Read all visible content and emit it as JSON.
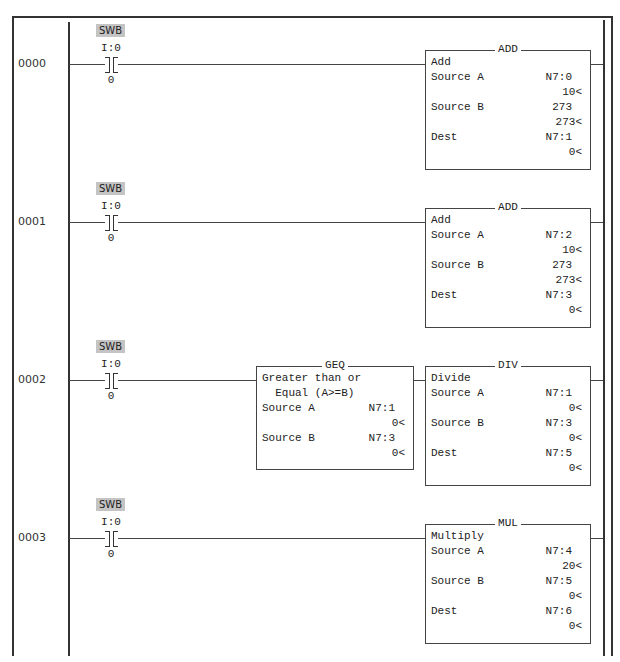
{
  "rungs": [
    {
      "number": "0000",
      "contact": {
        "tag": "SWB",
        "address": "I:0",
        "bit": "0"
      },
      "blocks": [
        {
          "mnemonic": "ADD",
          "description": [
            "Add"
          ],
          "params": [
            {
              "label": "Source A",
              "address": "N7:0",
              "value": "10<"
            },
            {
              "label": "Source B",
              "address": "273",
              "value": "273<"
            },
            {
              "label": "Dest",
              "address": "N7:1",
              "value": "0<"
            }
          ]
        }
      ]
    },
    {
      "number": "0001",
      "contact": {
        "tag": "SWB",
        "address": "I:0",
        "bit": "0"
      },
      "blocks": [
        {
          "mnemonic": "ADD",
          "description": [
            "Add"
          ],
          "params": [
            {
              "label": "Source A",
              "address": "N7:2",
              "value": "10<"
            },
            {
              "label": "Source B",
              "address": "273",
              "value": "273<"
            },
            {
              "label": "Dest",
              "address": "N7:3",
              "value": "0<"
            }
          ]
        }
      ]
    },
    {
      "number": "0002",
      "contact": {
        "tag": "SWB",
        "address": "I:0",
        "bit": "0"
      },
      "blocks": [
        {
          "mnemonic": "GEQ",
          "description": [
            "Greater than or",
            "  Equal (A>=B)"
          ],
          "params": [
            {
              "label": "Source A",
              "address": "N7:1",
              "value": "0<"
            },
            {
              "label": "Source B",
              "address": "N7:3",
              "value": "0<"
            }
          ]
        },
        {
          "mnemonic": "DIV",
          "description": [
            "Divide"
          ],
          "params": [
            {
              "label": "Source A",
              "address": "N7:1",
              "value": "0<"
            },
            {
              "label": "Source B",
              "address": "N7:3",
              "value": "0<"
            },
            {
              "label": "Dest",
              "address": "N7:5",
              "value": "0<"
            }
          ]
        }
      ]
    },
    {
      "number": "0003",
      "contact": {
        "tag": "SWB",
        "address": "I:0",
        "bit": "0"
      },
      "blocks": [
        {
          "mnemonic": "MUL",
          "description": [
            "Multiply"
          ],
          "params": [
            {
              "label": "Source A",
              "address": "N7:4",
              "value": "20<"
            },
            {
              "label": "Source B",
              "address": "N7:5",
              "value": "0<"
            },
            {
              "label": "Dest",
              "address": "N7:6",
              "value": "0<"
            }
          ]
        }
      ]
    }
  ]
}
